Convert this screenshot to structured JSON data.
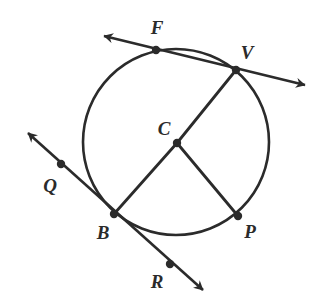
{
  "figure": {
    "kind": "circle-geometry-diagram",
    "background_color": "#ffffff",
    "stroke_color": "#2b2b2b",
    "label_color": "#2b2b2b",
    "width": 321,
    "height": 305,
    "circle": {
      "center_label": "C",
      "cx": 176,
      "cy": 142,
      "r": 93,
      "stroke_width": 2.6
    },
    "points": [
      {
        "id": "F",
        "label": "F",
        "x": 156,
        "y": 50,
        "label_x": 157,
        "label_y": 27,
        "on_circle": true
      },
      {
        "id": "V",
        "label": "V",
        "x": 236,
        "y": 70,
        "label_x": 247,
        "label_y": 52,
        "on_circle": true
      },
      {
        "id": "C",
        "label": "C",
        "x": 177,
        "y": 143,
        "label_x": 164,
        "label_y": 128,
        "on_circle": false
      },
      {
        "id": "Q",
        "label": "Q",
        "x": 61,
        "y": 164,
        "label_x": 50,
        "label_y": 185,
        "on_circle": false
      },
      {
        "id": "B",
        "label": "B",
        "x": 114,
        "y": 214,
        "label_x": 103,
        "label_y": 232,
        "on_circle": true
      },
      {
        "id": "P",
        "label": "P",
        "x": 238,
        "y": 216,
        "label_x": 250,
        "label_y": 231,
        "on_circle": true
      },
      {
        "id": "R",
        "label": "R",
        "x": 170,
        "y": 264,
        "label_x": 157,
        "label_y": 281,
        "on_circle": false
      }
    ],
    "dot_radius": 4.2,
    "segments": [
      {
        "id": "radius-CV",
        "from": "C",
        "to": "V",
        "x1": 177,
        "y1": 143,
        "x2": 236,
        "y2": 70
      },
      {
        "id": "radius-CB",
        "from": "C",
        "to": "B",
        "x1": 177,
        "y1": 143,
        "x2": 114,
        "y2": 214
      },
      {
        "id": "radius-CP",
        "from": "C",
        "to": "P",
        "x1": 177,
        "y1": 143,
        "x2": 238,
        "y2": 216
      }
    ],
    "lines": [
      {
        "id": "secant-FV",
        "through": [
          "F",
          "V"
        ],
        "x1": 104,
        "y1": 36,
        "x2": 305,
        "y2": 85,
        "arrow_start": true,
        "arrow_end": true
      },
      {
        "id": "secant-QBR",
        "through": [
          "Q",
          "B",
          "R"
        ],
        "x1": 28,
        "y1": 133,
        "x2": 203,
        "y2": 290,
        "arrow_start": true,
        "arrow_end": true
      }
    ]
  }
}
